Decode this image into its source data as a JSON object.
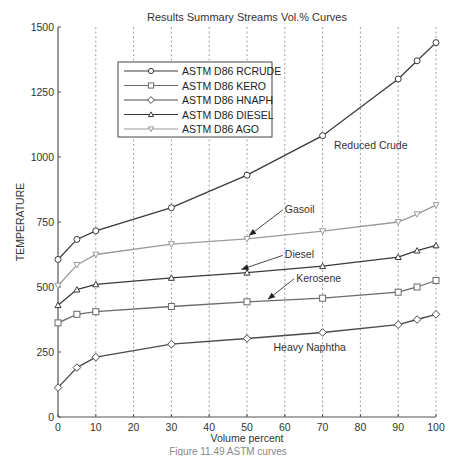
{
  "chart_data": {
    "type": "line",
    "title": "Results Summary Streams Vol.% Curves",
    "xlabel": "Volume percent",
    "ylabel": "TEMPERATURE",
    "xlim": [
      0,
      100
    ],
    "ylim": [
      0,
      1500
    ],
    "x_ticks": [
      0,
      10,
      20,
      30,
      40,
      50,
      60,
      70,
      80,
      90,
      100
    ],
    "y_ticks": [
      0,
      250,
      500,
      750,
      1000,
      1250,
      1500
    ],
    "grid": "vertical dotted",
    "legend_position": "upper left (inside)",
    "x": [
      0,
      5,
      10,
      30,
      50,
      70,
      90,
      95,
      100
    ],
    "series": [
      {
        "name": "ASTM D86 RCRUDE",
        "marker": "circle",
        "color": "#3a3a3a",
        "values": [
          606,
          683,
          716,
          805,
          930,
          1082,
          1300,
          1370,
          1440
        ]
      },
      {
        "name": "ASTM D86 KERO",
        "marker": "square",
        "color": "#6a6a6a",
        "values": [
          362,
          395,
          405,
          425,
          443,
          457,
          480,
          500,
          525
        ]
      },
      {
        "name": "ASTM D86 HNAPH",
        "marker": "diamond",
        "color": "#4a4a4a",
        "values": [
          113,
          190,
          230,
          280,
          302,
          325,
          355,
          375,
          395
        ]
      },
      {
        "name": "ASTM D86 DIESEL",
        "marker": "triangle-up",
        "color": "#3a3a3a",
        "values": [
          430,
          490,
          510,
          535,
          555,
          580,
          615,
          640,
          660
        ]
      },
      {
        "name": "ASTM D86 AGO",
        "marker": "triangle-down",
        "color": "#9a9a9a",
        "values": [
          505,
          585,
          625,
          665,
          685,
          715,
          750,
          780,
          815
        ]
      }
    ],
    "annotations": [
      {
        "text": "Reduced Crude",
        "x": 73,
        "y": 1030,
        "arrow": false
      },
      {
        "text": "Gasoil",
        "x": 60,
        "y": 785,
        "arrow_to": [
          50,
          690
        ]
      },
      {
        "text": "Diesel",
        "x": 60,
        "y": 610,
        "arrow_to": [
          48,
          560
        ]
      },
      {
        "text": "Kerosene",
        "x": 63,
        "y": 520,
        "arrow_to": [
          55,
          445
        ]
      },
      {
        "text": "Heavy Naphtha",
        "x": 57,
        "y": 255,
        "arrow": false
      }
    ]
  },
  "caption": "Figure 11.49 ASTM curves"
}
